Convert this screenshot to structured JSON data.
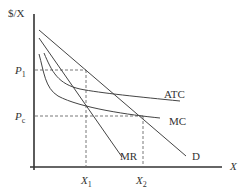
{
  "diagram": {
    "y_axis_label": "$/X",
    "x_axis_label": "X",
    "price_labels": [
      {
        "id": "p1",
        "base": "P",
        "sub": "1"
      },
      {
        "id": "pc",
        "base": "P",
        "sub": "c"
      }
    ],
    "quantity_labels": [
      {
        "id": "x1",
        "base": "X",
        "sub": "1"
      },
      {
        "id": "x2",
        "base": "X",
        "sub": "2"
      }
    ],
    "curves": [
      {
        "id": "demand",
        "label": "D"
      },
      {
        "id": "marginal-revenue",
        "label": "MR"
      },
      {
        "id": "average-total-cost",
        "label": "ATC"
      },
      {
        "id": "marginal-cost",
        "label": "MC"
      }
    ],
    "colors": {
      "axis": "#333333",
      "curve": "#444444",
      "guide": "#555555"
    }
  }
}
